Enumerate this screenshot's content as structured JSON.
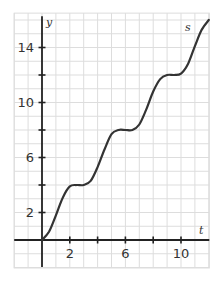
{
  "chart_data": {
    "type": "line",
    "title": "",
    "xlabel": "t",
    "ylabel": "y",
    "curve_label": "s",
    "xlim": [
      -2,
      12
    ],
    "ylim": [
      -2,
      16.5
    ],
    "grid": true,
    "x_ticks": [
      2,
      4,
      6,
      8,
      10
    ],
    "x_tick_labels": [
      "2",
      "6",
      "10"
    ],
    "x_tick_label_values": [
      2,
      6,
      10
    ],
    "y_ticks": [
      2,
      4,
      6,
      8,
      10,
      12,
      14
    ],
    "y_tick_labels": [
      "2",
      "6",
      "10",
      "14"
    ],
    "y_tick_label_values": [
      2,
      6,
      10,
      14
    ],
    "series": [
      {
        "name": "s",
        "description": "staircase curve: rises then plateaus at s=4, 8, 12",
        "x": [
          0,
          0.5,
          1,
          1.5,
          2,
          2.5,
          3,
          3.5,
          4,
          4.5,
          5,
          5.5,
          6,
          6.5,
          7,
          7.5,
          8,
          8.5,
          9,
          9.5,
          10,
          10.5,
          11,
          11.5,
          12
        ],
        "y": [
          0,
          0.6,
          1.8,
          3.1,
          3.9,
          4.0,
          4.0,
          4.3,
          5.3,
          6.6,
          7.7,
          8.0,
          8.0,
          8.0,
          8.4,
          9.5,
          10.8,
          11.7,
          12.0,
          12.0,
          12.1,
          12.8,
          14.1,
          15.3,
          16.0
        ]
      }
    ],
    "colors": {
      "curve": "#333333",
      "axes": "#222222",
      "grid": "#dddddd"
    }
  }
}
